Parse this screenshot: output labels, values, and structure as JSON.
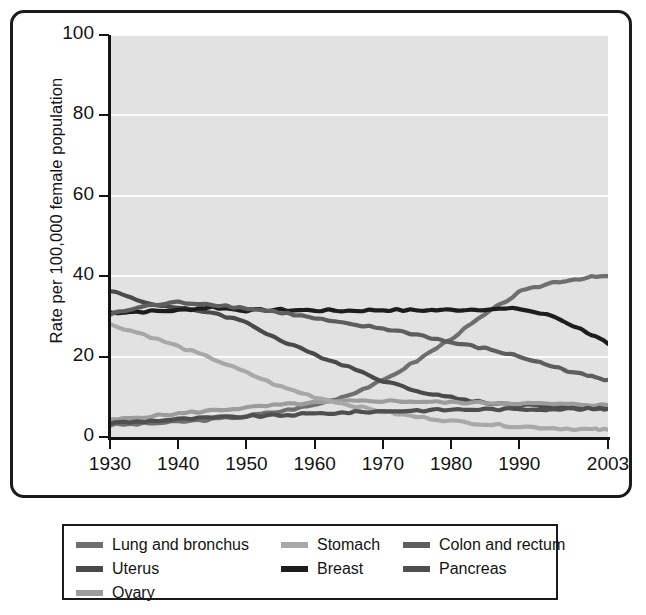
{
  "chart_data": {
    "type": "line",
    "title": "",
    "subtitle": "",
    "xlabel": "",
    "ylabel": "Rate per 100,000 female population",
    "xlim": [
      1930,
      2003
    ],
    "ylim": [
      0,
      100
    ],
    "grid": "horizontal",
    "legend_position": "below",
    "xticks": [
      "1930",
      "1940",
      "1950",
      "1960",
      "1970",
      "1980",
      "1990",
      "2003"
    ],
    "xtick_values": [
      1930,
      1940,
      1950,
      1960,
      1970,
      1980,
      1990,
      2003
    ],
    "yticks": [
      "0",
      "20",
      "40",
      "60",
      "80",
      "100"
    ],
    "ytick_values": [
      0,
      20,
      40,
      60,
      80,
      100
    ],
    "x": [
      1930,
      1935,
      1940,
      1945,
      1950,
      1955,
      1960,
      1965,
      1970,
      1975,
      1980,
      1985,
      1990,
      1995,
      2000,
      2003
    ],
    "series": [
      {
        "name": "Lung and bronchus",
        "color": "#6f6f6f",
        "values": [
          3.0,
          3.3,
          3.8,
          4.4,
          5.2,
          6.4,
          8.0,
          10.5,
          14.0,
          19.0,
          24.5,
          30.5,
          36.0,
          38.5,
          39.7,
          40.0
        ]
      },
      {
        "name": "Uterus",
        "color": "#4a4a4a",
        "values": [
          36.5,
          33.5,
          32.0,
          31.0,
          28.5,
          24.0,
          20.5,
          17.5,
          14.0,
          11.5,
          9.8,
          8.5,
          8.0,
          7.6,
          7.3,
          7.2
        ]
      },
      {
        "name": "Ovary",
        "color": "#9c9c9c",
        "values": [
          4.2,
          5.0,
          5.8,
          6.6,
          7.3,
          8.0,
          8.5,
          8.9,
          9.0,
          8.8,
          8.6,
          8.5,
          8.4,
          8.2,
          8.0,
          7.9
        ]
      },
      {
        "name": "Stomach",
        "color": "#a8a8a8",
        "values": [
          28.0,
          25.5,
          22.5,
          19.5,
          16.0,
          12.5,
          10.0,
          8.0,
          6.3,
          5.0,
          4.0,
          3.2,
          2.6,
          2.2,
          1.9,
          1.8
        ]
      },
      {
        "name": "Breast",
        "color": "#1d1d1d",
        "values": [
          31.0,
          31.2,
          31.5,
          32.3,
          31.5,
          31.6,
          31.5,
          31.4,
          31.6,
          31.5,
          31.6,
          31.8,
          31.9,
          30.0,
          26.0,
          23.2
        ]
      },
      {
        "name": "Colon and rectum",
        "color": "#5e5e5e",
        "values": [
          30.5,
          32.5,
          33.5,
          33.0,
          32.0,
          31.0,
          29.5,
          28.0,
          27.0,
          25.5,
          23.5,
          22.0,
          20.0,
          17.5,
          15.2,
          14.2
        ]
      },
      {
        "name": "Pancreas",
        "color": "#4f4f4f",
        "values": [
          3.5,
          3.9,
          4.4,
          4.8,
          5.1,
          5.4,
          5.8,
          6.1,
          6.4,
          6.6,
          6.8,
          6.9,
          6.9,
          7.0,
          7.0,
          7.0
        ]
      }
    ]
  },
  "axis": {
    "y_title": "Rate per 100,000 female population",
    "y_ticks": [
      "100",
      "80",
      "60",
      "40",
      "20",
      "0"
    ],
    "x_ticks": [
      "1930",
      "1940",
      "1950",
      "1960",
      "1970",
      "1980",
      "1990",
      "2003"
    ]
  },
  "legend": {
    "columns": [
      {
        "items": [
          {
            "label": "Lung and bronchus",
            "color": "#6f6f6f"
          },
          {
            "label": "Uterus",
            "color": "#4a4a4a"
          },
          {
            "label": "Ovary",
            "color": "#9c9c9c"
          }
        ]
      },
      {
        "items": [
          {
            "label": "Stomach",
            "color": "#a8a8a8"
          },
          {
            "label": "Breast",
            "color": "#1d1d1d"
          }
        ]
      },
      {
        "items": [
          {
            "label": "Colon and rectum",
            "color": "#5e5e5e"
          },
          {
            "label": "Pancreas",
            "color": "#4f4f4f"
          }
        ]
      }
    ]
  },
  "colors": {
    "plot_background": "#e2e2e2",
    "gridline": "#fbfbfb",
    "axis": "#141414",
    "frame": "#1b1b1b"
  }
}
